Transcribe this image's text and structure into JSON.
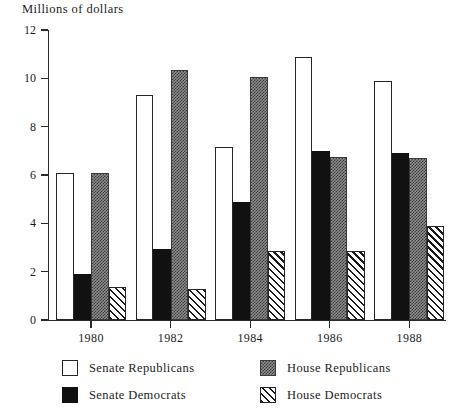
{
  "chart_data": {
    "type": "bar",
    "title": "Millions of dollars",
    "xlabel": "",
    "ylabel": "Millions of dollars",
    "ylim": [
      0,
      12
    ],
    "ytick_labels": [
      "0",
      "2",
      "4",
      "6",
      "8",
      "10",
      "12"
    ],
    "ytick_values": [
      0,
      2,
      4,
      6,
      8,
      10,
      12
    ],
    "grid": false,
    "legend_position": "bottom",
    "categories": [
      "1980",
      "1982",
      "1984",
      "1986",
      "1988"
    ],
    "series": [
      {
        "name": "Senate Republicans",
        "pattern": "open-white",
        "color": "#ffffff",
        "values": [
          6.1,
          9.3,
          7.15,
          10.9,
          9.9
        ]
      },
      {
        "name": "Senate Democrats",
        "pattern": "solid-black",
        "color": "#111111",
        "values": [
          1.9,
          2.95,
          4.9,
          7.0,
          6.9
        ]
      },
      {
        "name": "House Republicans",
        "pattern": "stipple-gray",
        "color": "#8e8e8e",
        "values": [
          6.1,
          10.35,
          10.05,
          6.75,
          6.7
        ]
      },
      {
        "name": "House Democrats",
        "pattern": "diagonal-hatch",
        "color": "#ffffff",
        "values": [
          1.35,
          1.3,
          2.85,
          2.85,
          3.9
        ]
      }
    ]
  },
  "legend": {
    "entries": [
      {
        "label": "Senate Republicans",
        "swatch": "open-white"
      },
      {
        "label": "House Republicans",
        "swatch": "stipple-gray"
      },
      {
        "label": "Senate Democrats",
        "swatch": "solid-black"
      },
      {
        "label": "House Democrats",
        "swatch": "diagonal-hatch"
      }
    ]
  }
}
